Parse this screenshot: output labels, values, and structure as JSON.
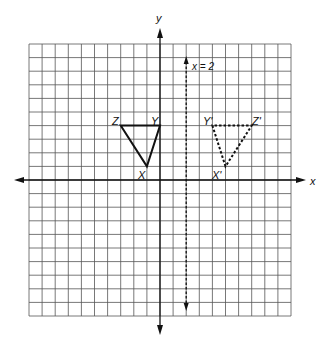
{
  "diagram": {
    "type": "coordinate-grid-reflection",
    "grid": {
      "xmin": -10,
      "xmax": 10,
      "ymin": -10,
      "ymax": 10,
      "step": 1
    },
    "axes": {
      "x_label": "x",
      "y_label": "y"
    },
    "reflection_line": {
      "equation_label": "x = 2",
      "x": 2,
      "style": "dashed"
    },
    "preimage": {
      "name": "triangle XYZ",
      "style": "solid",
      "vertices": [
        {
          "label": "X",
          "x": -1,
          "y": 1
        },
        {
          "label": "Y",
          "x": 0,
          "y": 4
        },
        {
          "label": "Z",
          "x": -3,
          "y": 4
        }
      ]
    },
    "image": {
      "name": "triangle X'Y'Z'",
      "style": "dashed",
      "vertices": [
        {
          "label": "X'",
          "x": 5,
          "y": 1
        },
        {
          "label": "Y'",
          "x": 4,
          "y": 4
        },
        {
          "label": "Z'",
          "x": 7,
          "y": 4
        }
      ]
    }
  }
}
